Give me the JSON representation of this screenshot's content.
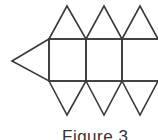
{
  "figure": {
    "caption": "Figure 3",
    "stroke_color": "#3a3a3a",
    "stroke_width": 1.6,
    "left_triangle": {
      "tip": [
        12,
        61
      ],
      "base_top": [
        49,
        39
      ],
      "base_bottom": [
        49,
        81
      ]
    },
    "squares": [
      {
        "x": 49,
        "y": 39,
        "w": 37,
        "h": 42
      },
      {
        "x": 86,
        "y": 39,
        "w": 36,
        "h": 42
      },
      {
        "x": 122,
        "y": 39,
        "w": 38,
        "h": 42
      }
    ],
    "top_triangles": [
      {
        "apex": [
          67,
          6
        ],
        "left": [
          49,
          39
        ],
        "right": [
          86,
          39
        ]
      },
      {
        "apex": [
          104,
          6
        ],
        "left": [
          86,
          39
        ],
        "right": [
          122,
          39
        ]
      },
      {
        "apex": [
          140,
          6
        ],
        "left": [
          122,
          39
        ],
        "right": [
          158,
          39
        ]
      }
    ],
    "bottom_triangles": [
      {
        "apex": [
          67,
          115
        ],
        "left": [
          49,
          81
        ],
        "right": [
          86,
          81
        ]
      },
      {
        "apex": [
          104,
          115
        ],
        "left": [
          86,
          81
        ],
        "right": [
          122,
          81
        ]
      },
      {
        "apex": [
          140,
          115
        ],
        "left": [
          122,
          81
        ],
        "right": [
          158,
          81
        ]
      }
    ]
  }
}
